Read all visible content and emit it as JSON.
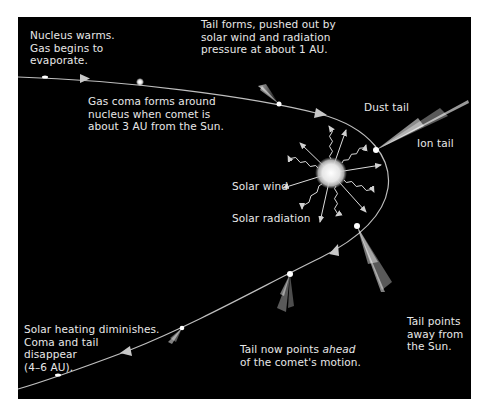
{
  "diagram": {
    "colors": {
      "background": "#000000",
      "orbit": "#bfbfbf",
      "text": "#e8e8e8",
      "sun": "#f2f2f2"
    },
    "labels": {
      "nucleus_warms": [
        "Nucleus warms.",
        "Gas begins to",
        "evaporate."
      ],
      "gas_coma": [
        "Gas coma forms around",
        "nucleus when comet is",
        "about 3 AU from the Sun."
      ],
      "tail_forms": [
        "Tail forms, pushed out by",
        "solar wind and radiation",
        "pressure at about 1 AU."
      ],
      "dust_tail": "Dust tail",
      "ion_tail": "Ion tail",
      "solar_wind": "Solar wind",
      "solar_radiation": "Solar radiation",
      "tail_points_away": [
        "Tail points",
        "away from",
        "the Sun."
      ],
      "tail_ahead_prefix": "Tail now points ",
      "tail_ahead_emph": "ahead",
      "tail_ahead_line2": "of the comet's motion.",
      "heating_diminishes": [
        "Solar heating diminishes.",
        "Coma and tail",
        "disappear",
        "(4–6 AU)."
      ]
    },
    "icons": {
      "sun": "sun-icon",
      "comet": "comet-icon",
      "orbit_arrow": "arrow-icon"
    }
  }
}
